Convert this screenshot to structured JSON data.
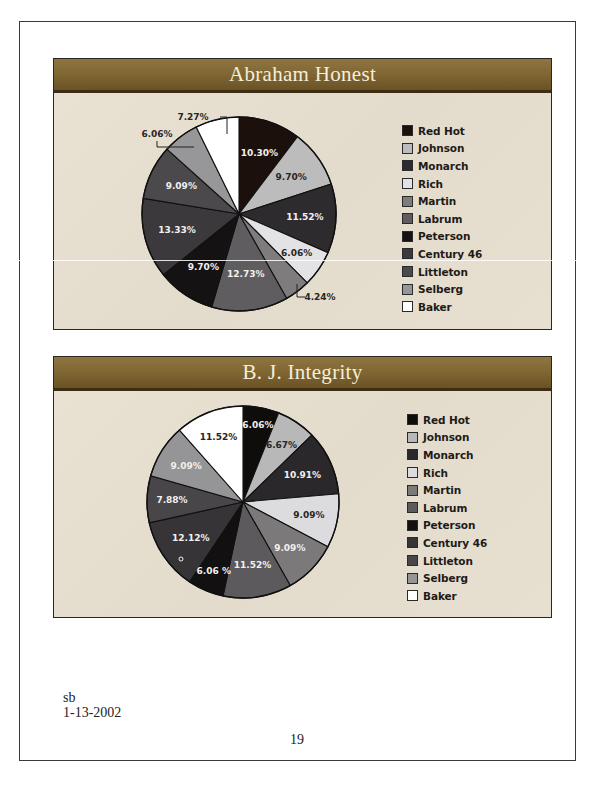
{
  "chart_data": [
    {
      "type": "pie",
      "title": "Abraham Honest",
      "categories": [
        "Red Hot",
        "Johnson",
        "Monarch",
        "Rich",
        "Martin",
        "Labrum",
        "Peterson",
        "Century 46",
        "Littleton",
        "Selberg",
        "Baker"
      ],
      "values": [
        10.3,
        9.7,
        11.52,
        6.06,
        4.24,
        12.73,
        9.7,
        13.33,
        9.09,
        6.06,
        7.27
      ],
      "labels": [
        "10.30%",
        "9.70%",
        "11.52%",
        "6.06%",
        "4.24%",
        "12.73%",
        "9.70%",
        "13.33%",
        "9.09%",
        "6.06%",
        "7.27%"
      ],
      "colors": [
        "#1c100c",
        "#bcbcbc",
        "#2e2b2e",
        "#e3e3e5",
        "#7e7c7d",
        "#5f5d5f",
        "#151213",
        "#3b393c",
        "#4b494b",
        "#979799",
        "#ffffff"
      ],
      "start_angle": "12 o'clock, clockwise",
      "legend_position": "right",
      "external_labels": [
        {
          "slice": 4,
          "text": "4.24%"
        },
        {
          "slice": 9,
          "text": "6.06%"
        },
        {
          "slice": 10,
          "text": "7.27%"
        }
      ]
    },
    {
      "type": "pie",
      "title": "B. J. Integrity",
      "categories": [
        "Red Hot",
        "Johnson",
        "Monarch",
        "Rich",
        "Martin",
        "Labrum",
        "Peterson",
        "Century 46",
        "Littleton",
        "Selberg",
        "Baker"
      ],
      "values": [
        6.06,
        6.67,
        10.91,
        9.09,
        9.09,
        11.52,
        6.06,
        12.12,
        7.88,
        9.09,
        11.52
      ],
      "labels": [
        "6.06%",
        "6.67%",
        "10.91%",
        "9.09%",
        "9.09%",
        "11.52%",
        "6.06 %",
        "12.12%",
        "7.88%",
        "9.09%",
        "11.52%"
      ],
      "colors": [
        "#0f0c0c",
        "#b8b8b8",
        "#2a282b",
        "#dcdcde",
        "#7b797a",
        "#5c5a5c",
        "#121010",
        "#363437",
        "#484648",
        "#959597",
        "#ffffff"
      ],
      "start_angle": "12 o'clock, clockwise",
      "legend_position": "right"
    }
  ],
  "panels": [
    {
      "title": "Abraham Honest"
    },
    {
      "title": "B. J. Integrity"
    }
  ],
  "footer": {
    "author": "sb",
    "date": "1-13-2002",
    "page_number": "19"
  }
}
